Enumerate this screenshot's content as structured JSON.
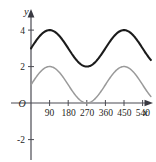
{
  "figure": {
    "corner_mark": "",
    "axis_labels": {
      "x": "x",
      "y": "y",
      "origin": "O"
    }
  },
  "chart_data": {
    "type": "line",
    "title": "",
    "subtitle": "",
    "xlabel": "x",
    "ylabel": "y",
    "grid": false,
    "legend_position": "none",
    "xlim": [
      -18,
      585
    ],
    "ylim": [
      -2.9,
      4.9
    ],
    "xticks": [
      90,
      180,
      270,
      360,
      450,
      540
    ],
    "xtick_labels": [
      "90",
      "180",
      "270",
      "360",
      "450",
      "540"
    ],
    "yticks": [
      4,
      2,
      -2
    ],
    "ytick_labels": [
      "4",
      "2",
      "-2"
    ],
    "x_tick_step_degrees": 90,
    "annotations": [],
    "series": [
      {
        "name": "black-curve",
        "color": "#1b1b1b",
        "style": "solid",
        "width": 2.1,
        "form": "sine",
        "amplitude": 1,
        "midline": 3,
        "period_degrees": 360,
        "phase_shift_degrees": 0,
        "maxima": [
          [
            90,
            4
          ],
          [
            450,
            4
          ]
        ],
        "minima": [
          [
            270,
            2
          ]
        ],
        "x_start": 0,
        "x_end": 580,
        "y_at_x_start": 3,
        "y_range": [
          2,
          4
        ],
        "points": [
          [
            0,
            3.0
          ],
          [
            30,
            3.5
          ],
          [
            60,
            3.87
          ],
          [
            90,
            4.0
          ],
          [
            120,
            3.87
          ],
          [
            150,
            3.5
          ],
          [
            180,
            3.0
          ],
          [
            210,
            2.5
          ],
          [
            240,
            2.13
          ],
          [
            270,
            2.0
          ],
          [
            300,
            2.13
          ],
          [
            330,
            2.5
          ],
          [
            360,
            3.0
          ],
          [
            390,
            3.5
          ],
          [
            420,
            3.87
          ],
          [
            450,
            4.0
          ],
          [
            480,
            3.87
          ],
          [
            510,
            3.5
          ],
          [
            540,
            3.0
          ],
          [
            570,
            2.5
          ],
          [
            580,
            2.34
          ]
        ]
      },
      {
        "name": "gray-curve",
        "color": "#9a9a9a",
        "style": "solid",
        "width": 1.5,
        "form": "sine",
        "amplitude": 1,
        "midline": 1,
        "period_degrees": 360,
        "phase_shift_degrees": 0,
        "maxima": [
          [
            90,
            2
          ],
          [
            450,
            2
          ]
        ],
        "minima": [
          [
            270,
            0
          ]
        ],
        "x_start": 0,
        "x_end": 580,
        "y_at_x_start": 1,
        "y_range": [
          0,
          2
        ],
        "points": [
          [
            0,
            1.0
          ],
          [
            30,
            1.5
          ],
          [
            60,
            1.87
          ],
          [
            90,
            2.0
          ],
          [
            120,
            1.87
          ],
          [
            150,
            1.5
          ],
          [
            180,
            1.0
          ],
          [
            210,
            0.5
          ],
          [
            240,
            0.13
          ],
          [
            270,
            0.0
          ],
          [
            300,
            0.13
          ],
          [
            330,
            0.5
          ],
          [
            360,
            1.0
          ],
          [
            390,
            1.5
          ],
          [
            420,
            1.87
          ],
          [
            450,
            2.0
          ],
          [
            480,
            1.87
          ],
          [
            510,
            1.5
          ],
          [
            540,
            1.0
          ],
          [
            570,
            0.5
          ],
          [
            580,
            0.34
          ]
        ]
      }
    ]
  }
}
